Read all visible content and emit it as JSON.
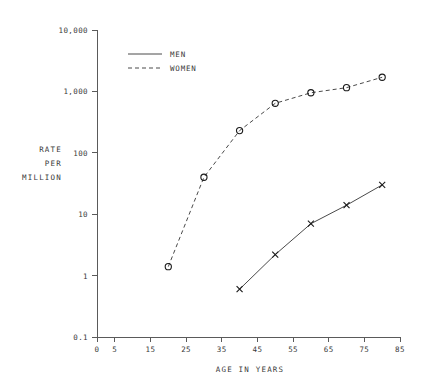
{
  "chart_data": {
    "type": "line",
    "title": "",
    "xlabel": "AGE IN YEARS",
    "ylabel": "RATE PER MILLION",
    "ylabel_lines": [
      "RATE",
      "PER",
      "MILLION"
    ],
    "yscale": "log",
    "xscale": "linear",
    "xlim": [
      0,
      85
    ],
    "ylim": [
      0.1,
      10000
    ],
    "grid": false,
    "legend_position": "top-left-inside",
    "x_ticks": [
      0,
      5,
      15,
      25,
      35,
      45,
      55,
      65,
      75,
      85
    ],
    "x_tick_labels": [
      "0",
      "5",
      "15",
      "25",
      "35",
      "45",
      "55",
      "65",
      "75",
      "85"
    ],
    "y_ticks": [
      0.1,
      1,
      10,
      100,
      1000,
      10000
    ],
    "y_tick_labels": [
      "0.1",
      "1",
      "10",
      "100",
      "1,000",
      "10,000"
    ],
    "series": [
      {
        "name": "MEN",
        "linestyle": "solid",
        "marker": "x",
        "color": "#4a4a4a",
        "x": [
          40,
          50,
          60,
          70,
          80
        ],
        "values": [
          0.6,
          2.2,
          7.0,
          14.0,
          30.0
        ]
      },
      {
        "name": "WOMEN",
        "linestyle": "dashed",
        "marker": "o",
        "color": "#4a4a4a",
        "x": [
          20,
          30,
          40,
          50,
          60,
          70,
          80
        ],
        "values": [
          1.4,
          40.0,
          230.0,
          640.0,
          950.0,
          1150.0,
          1700.0
        ]
      }
    ],
    "legend": [
      {
        "label": "MEN",
        "linestyle": "solid"
      },
      {
        "label": "WOMEN",
        "linestyle": "dashed"
      }
    ]
  }
}
